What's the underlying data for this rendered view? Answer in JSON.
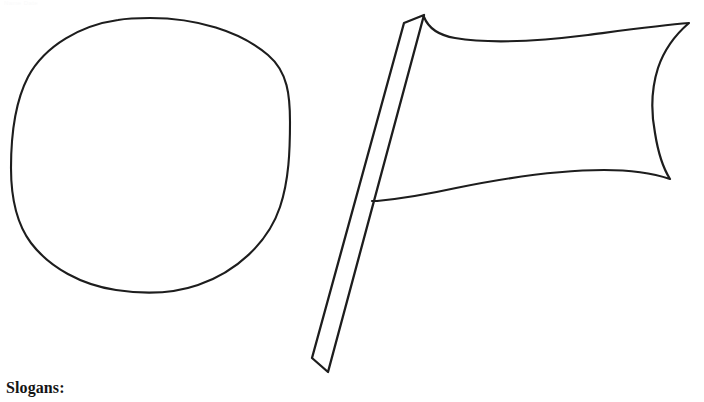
{
  "page": {
    "background_color": "#ffffff",
    "ink_color": "#1d1d1d",
    "width": 704,
    "height": 402,
    "header_artifact_text": "Name                Date"
  },
  "caption": {
    "slogans_label": "Slogans:"
  },
  "figures": [
    {
      "name": "circle-outline",
      "shape": "circle",
      "description": "Large hand-drawn empty circle outline on the left half of the sheet",
      "center_x": 150,
      "center_y": 156,
      "radius_x": 140,
      "radius_y": 138,
      "stroke_width": 2.1,
      "fill": "none"
    },
    {
      "name": "flag-outline",
      "shape": "flag",
      "description": "Hand-drawn waving flag outline with a diagonal flagpole on the right half of the sheet",
      "pole": {
        "top_left_x": 404,
        "top_left_y": 23,
        "top_right_x": 424,
        "top_right_y": 15,
        "bottom_right_x": 328,
        "bottom_right_y": 372,
        "bottom_left_x": 312,
        "bottom_left_y": 358,
        "stroke_width": 2.3
      },
      "banner": {
        "hoist_top_x": 424,
        "hoist_top_y": 17,
        "fly_top_x": 689,
        "fly_top_y": 23,
        "fly_bottom_x": 658,
        "fly_bottom_y": 179,
        "hoist_bottom_x": 377,
        "hoist_bottom_y": 201,
        "stroke_width": 2.2
      }
    }
  ]
}
